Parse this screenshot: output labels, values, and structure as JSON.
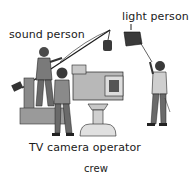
{
  "illustration": {
    "description": "TV studio crew illustration",
    "labels": {
      "sound_person": "sound person",
      "light_person": "light person",
      "camera_operator": "TV camera operator",
      "crew": "crew"
    },
    "colors": {
      "ink": "#1a1a1a",
      "shade_dark": "#555555",
      "shade_mid": "#8a8a8a",
      "shade_light": "#c8c8c8",
      "background": "#ffffff"
    }
  }
}
